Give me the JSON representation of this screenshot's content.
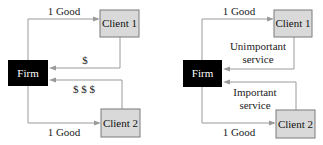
{
  "diagrams": [
    {
      "firm_label": "Firm",
      "client1_label": "Client 1",
      "client2_label": "Client 2",
      "top_flow_label": "1 Good",
      "bottom_flow_label": "1 Good",
      "client1_return_label": [
        "$"
      ],
      "client2_return_label": [
        "$ $ $"
      ]
    },
    {
      "firm_label": "Firm",
      "client1_label": "Client 1",
      "client2_label": "Client 2",
      "top_flow_label": "1 Good",
      "bottom_flow_label": "1 Good",
      "client1_return_label": [
        "Unimportant",
        "service"
      ],
      "client2_return_label": [
        "Important",
        "service"
      ]
    }
  ],
  "colors": {
    "firm_fill": "#000000",
    "client_fill": "#d9d9d9",
    "arrow": "#9a9a9a"
  }
}
